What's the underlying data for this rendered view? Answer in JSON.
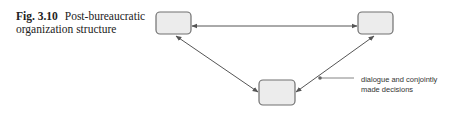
{
  "figure": {
    "label": "Fig. 3.10",
    "title": "Post-bureaucratic organization structure"
  },
  "diagram": {
    "nodes": [
      {
        "id": "top-left",
        "label": ""
      },
      {
        "id": "top-right",
        "label": ""
      },
      {
        "id": "bottom",
        "label": ""
      }
    ],
    "edges": [
      {
        "from": "top-left",
        "to": "top-right",
        "type": "bidirectional"
      },
      {
        "from": "top-left",
        "to": "bottom",
        "type": "bidirectional"
      },
      {
        "from": "top-right",
        "to": "bottom",
        "type": "bidirectional"
      }
    ],
    "annotation": {
      "line1": "dialogue and conjointly",
      "line2": "made decisions"
    },
    "colors": {
      "box_fill": "#ececec",
      "box_stroke": "#707070",
      "arrow": "#555555"
    }
  }
}
